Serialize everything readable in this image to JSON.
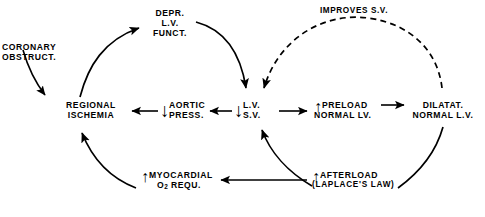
{
  "figure": {
    "type": "flow-diagram",
    "background_color": "#ffffff",
    "ink_color": "#000000"
  },
  "nodes": {
    "coronary_obstruct": {
      "line1": "CORONARY",
      "line2": "OBSTRUCT."
    },
    "depr_lv_funct": {
      "line1": "DEPR.",
      "line2": "L.V.",
      "line3": "FUNCT."
    },
    "regional_ischemia": {
      "line1": "REGIONAL",
      "line2": "ISCHEMIA"
    },
    "aortic_press": {
      "arrow": "↓",
      "line1": "AORTIC",
      "line2": "PRESS."
    },
    "lv_sv": {
      "arrow": "↓",
      "line1": "L.V.",
      "line2": "S.V."
    },
    "preload": {
      "arrow": "↑",
      "line1": "PRELOAD",
      "line2": "NORMAL LV."
    },
    "dilatat": {
      "line1": "DILATAT.",
      "line2": "NORMAL L.V."
    },
    "myocardial_o2": {
      "arrow": "↑",
      "line1a": "MYOCARDIAL",
      "line2a": "O",
      "line2sub": "2",
      "line2b": " REQU."
    },
    "afterload": {
      "arrow": "↑",
      "line1": "AFTERLOAD",
      "line2": "(LAPLACE'S LAW)"
    }
  },
  "edge_labels": {
    "improves_sv": {
      "line1": "IMPROVES",
      "line2": "S.V."
    }
  },
  "edges": [
    {
      "name": "coronary-obstruct-to-regional-ischemia",
      "from": "coronary_obstruct",
      "to": "regional_ischemia",
      "style": "solid",
      "shape": "curve"
    },
    {
      "name": "regional-ischemia-to-depr-lv-funct",
      "from": "regional_ischemia",
      "to": "depr_lv_funct",
      "style": "solid",
      "shape": "arc"
    },
    {
      "name": "depr-lv-funct-to-lv-sv",
      "from": "depr_lv_funct",
      "to": "lv_sv",
      "style": "solid",
      "shape": "arc"
    },
    {
      "name": "lv-sv-to-aortic-press",
      "from": "lv_sv",
      "to": "aortic_press",
      "style": "solid",
      "shape": "straight"
    },
    {
      "name": "aortic-press-to-regional-ischemia",
      "from": "aortic_press",
      "to": "regional_ischemia",
      "style": "solid",
      "shape": "straight"
    },
    {
      "name": "lv-sv-to-preload",
      "from": "lv_sv",
      "to": "preload",
      "style": "solid",
      "shape": "straight"
    },
    {
      "name": "preload-to-dilatat",
      "from": "preload",
      "to": "dilatat",
      "style": "solid",
      "shape": "straight"
    },
    {
      "name": "dilatat-to-lv-sv-improves-sv",
      "from": "dilatat",
      "to": "lv_sv",
      "style": "dashed",
      "shape": "arc",
      "label": "improves_sv"
    },
    {
      "name": "dilatat-to-afterload",
      "from": "dilatat",
      "to": "afterload",
      "style": "solid",
      "shape": "arc"
    },
    {
      "name": "afterload-to-lv-sv",
      "from": "afterload",
      "to": "lv_sv",
      "style": "solid",
      "shape": "arc"
    },
    {
      "name": "afterload-to-myocardial-o2",
      "from": "afterload",
      "to": "myocardial_o2",
      "style": "solid",
      "shape": "straight"
    },
    {
      "name": "myocardial-o2-to-regional-ischemia",
      "from": "myocardial_o2",
      "to": "regional_ischemia",
      "style": "solid",
      "shape": "arc"
    }
  ]
}
